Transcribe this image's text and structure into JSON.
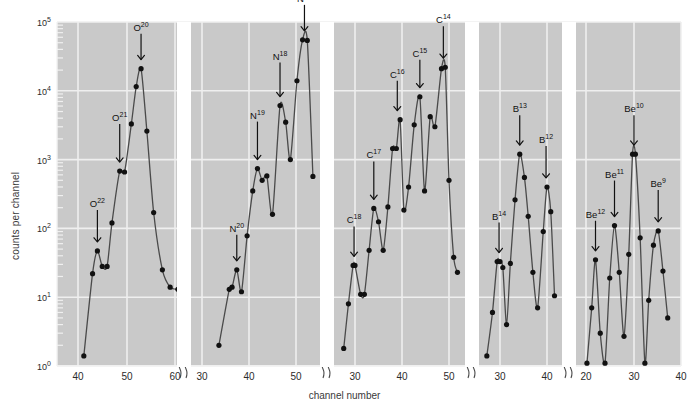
{
  "figure": {
    "background": "#ffffff",
    "plot_background": "#c9c9c9",
    "grid_color": "#efefef",
    "line_color": "#4a4a4a",
    "marker_color": "#111111"
  },
  "axes": {
    "xlabel": "channel number",
    "ylabel": "counts per channel",
    "y_ticks": [
      {
        "label": "10",
        "exp": "0",
        "value": 1
      },
      {
        "label": "10",
        "exp": "1",
        "value": 10
      },
      {
        "label": "10",
        "exp": "2",
        "value": 100
      },
      {
        "label": "10",
        "exp": "3",
        "value": 1000
      },
      {
        "label": "10",
        "exp": "4",
        "value": 10000
      },
      {
        "label": "10",
        "exp": "5",
        "value": 100000
      }
    ],
    "ylim": [
      1,
      100000
    ],
    "y_log": true,
    "grid": true,
    "axis_break_symbol": "//"
  },
  "chart_data": {
    "type": "line",
    "title": "",
    "xlabel": "channel number",
    "ylabel": "counts per channel",
    "yscale": "log",
    "ylim": [
      1,
      100000
    ],
    "grid": true,
    "legend": "none",
    "segments": [
      {
        "name": "oxygen",
        "x_ticks": [
          40,
          50,
          60
        ],
        "x_range": [
          41,
          62
        ],
        "x": [
          41.2,
          43.0,
          44.0,
          45.0,
          46.0,
          47.0,
          48.6,
          49.6,
          51.0,
          52.0,
          53.0,
          54.2,
          55.6,
          57.4,
          59.0,
          60.6
        ],
        "y": [
          1.4,
          22,
          47,
          28,
          28,
          120,
          680,
          660,
          3300,
          11500,
          21000,
          2600,
          170,
          25,
          14,
          13
        ],
        "peaks": [
          {
            "element": "O",
            "mass": "22",
            "x": 44.0,
            "y": 47
          },
          {
            "element": "O",
            "mass": "21",
            "x": 48.6,
            "y": 680
          },
          {
            "element": "O",
            "mass": "20",
            "x": 53.0,
            "y": 21000
          }
        ]
      },
      {
        "name": "nitrogen",
        "x_ticks": [
          30,
          40,
          50
        ],
        "x_range": [
          33,
          54
        ],
        "x": [
          33.6,
          35.8,
          36.4,
          37.4,
          38.4,
          39.6,
          40.8,
          41.8,
          42.8,
          43.8,
          45.0,
          46.6,
          47.8,
          48.8,
          50.2,
          51.4,
          52.4,
          53.6
        ],
        "y": [
          2.0,
          13,
          14,
          25,
          12,
          78,
          350,
          740,
          500,
          580,
          160,
          6100,
          3500,
          1000,
          14000,
          55000,
          54000,
          570
        ],
        "peaks": [
          {
            "element": "N",
            "mass": "20",
            "x": 37.4,
            "y": 25
          },
          {
            "element": "N",
            "mass": "19",
            "x": 41.8,
            "y": 740
          },
          {
            "element": "N",
            "mass": "18",
            "x": 46.6,
            "y": 6100
          },
          {
            "element": "N",
            "mass": "17",
            "x": 51.8,
            "y": 55000
          }
        ]
      },
      {
        "name": "carbon",
        "x_ticks": [
          30,
          40,
          50
        ],
        "x_range": [
          27,
          52
        ],
        "x": [
          27.6,
          28.6,
          29.6,
          30.0,
          31.2,
          32.0,
          33.0,
          34.0,
          35.0,
          36.0,
          37.0,
          38.0,
          38.8,
          39.6,
          40.4,
          41.4,
          42.6,
          43.8,
          44.8,
          46.0,
          47.0,
          48.4,
          49.2,
          50.0,
          51.0,
          51.8
        ],
        "y": [
          1.8,
          8.0,
          29,
          29,
          11,
          11,
          48,
          195,
          125,
          48,
          205,
          1450,
          1450,
          3800,
          185,
          400,
          3200,
          8200,
          350,
          4200,
          3000,
          21000,
          22000,
          500,
          38,
          23
        ],
        "peaks": [
          {
            "element": "C",
            "mass": "18",
            "x": 29.8,
            "y": 29
          },
          {
            "element": "C",
            "mass": "17",
            "x": 34.0,
            "y": 195
          },
          {
            "element": "C",
            "mass": "16",
            "x": 39.0,
            "y": 3800
          },
          {
            "element": "C",
            "mass": "15",
            "x": 43.8,
            "y": 8200
          },
          {
            "element": "C",
            "mass": "14",
            "x": 48.8,
            "y": 22000
          }
        ]
      },
      {
        "name": "boron",
        "x_ticks": [
          30,
          40
        ],
        "x_range": [
          27,
          42
        ],
        "x": [
          27.2,
          28.4,
          29.4,
          30.0,
          30.6,
          31.4,
          32.2,
          33.2,
          34.2,
          35.2,
          36.0,
          37.0,
          38.0,
          39.2,
          40.0,
          40.8,
          41.6
        ],
        "y": [
          1.4,
          6.0,
          33,
          33,
          27,
          4.0,
          31,
          260,
          1200,
          550,
          150,
          23,
          7.0,
          90,
          400,
          175,
          10.5
        ],
        "peaks": [
          {
            "element": "B",
            "mass": "14",
            "x": 29.8,
            "y": 33
          },
          {
            "element": "B",
            "mass": "13",
            "x": 34.2,
            "y": 1200
          },
          {
            "element": "B",
            "mass": "12",
            "x": 39.8,
            "y": 400
          }
        ]
      },
      {
        "name": "beryllium",
        "x_ticks": [
          20,
          30,
          40
        ],
        "x_range": [
          20,
          38
        ],
        "x": [
          20.2,
          21.2,
          22.0,
          23.0,
          24.0,
          25.0,
          26.0,
          27.0,
          28.0,
          29.0,
          29.8,
          30.4,
          31.4,
          32.4,
          33.2,
          34.2,
          35.2,
          36.2,
          37.2
        ],
        "y": [
          1.1,
          7.0,
          35,
          3.0,
          1.1,
          19,
          110,
          23,
          2.7,
          42,
          1200,
          1200,
          73,
          1.1,
          9.0,
          57,
          92,
          24,
          5.0
        ],
        "peaks": [
          {
            "element": "Be",
            "mass": "12",
            "x": 22.0,
            "y": 35
          },
          {
            "element": "Be",
            "mass": "11",
            "x": 26.0,
            "y": 110
          },
          {
            "element": "Be",
            "mass": "10",
            "x": 30.1,
            "y": 1200
          },
          {
            "element": "Be",
            "mass": "9",
            "x": 35.2,
            "y": 92
          }
        ]
      }
    ]
  }
}
